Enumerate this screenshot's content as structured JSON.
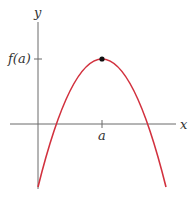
{
  "diagram": {
    "type": "function graph (local maximum)",
    "axes": {
      "x_label": "x",
      "y_label": "y",
      "axis_color": "#6b6b6b"
    },
    "ticks": {
      "x_tick_label": "a",
      "y_tick_label": "f(a)"
    },
    "curve": {
      "shape": "downward parabola",
      "color": "#d2313e",
      "maximum_point": "(a, f(a))"
    },
    "point": {
      "color": "#111111",
      "label": "maximum at (a, f(a))"
    }
  }
}
